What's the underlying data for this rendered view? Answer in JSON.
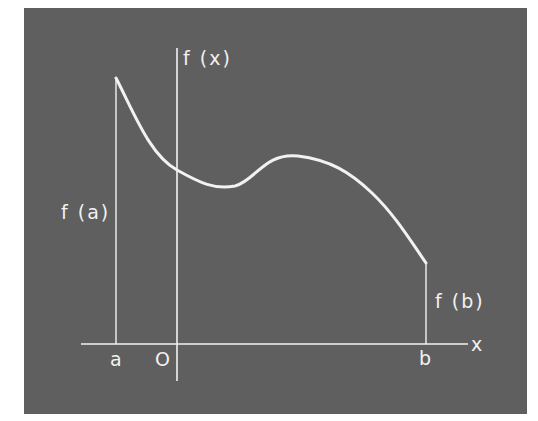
{
  "diagram": {
    "colors": {
      "background": "#5f5f5f",
      "stroke": "#f2f2f2",
      "page": "#ffffff"
    },
    "labels": {
      "y_axis": "f (x)",
      "x_axis": "x",
      "origin": "O",
      "a": "a",
      "b": "b",
      "f_a": "f (a)",
      "f_b": "f (b)"
    },
    "curve": {
      "points": [
        [
          116,
          78
        ],
        [
          177,
          170
        ],
        [
          228,
          189
        ],
        [
          298,
          156
        ],
        [
          362,
          180
        ],
        [
          426,
          263
        ]
      ],
      "start_label": "f (a)",
      "end_label": "f (b)"
    }
  }
}
